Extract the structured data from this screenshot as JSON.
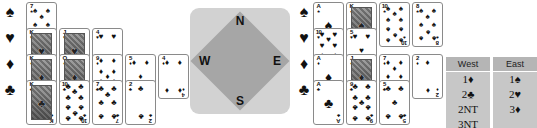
{
  "hands": {
    "west": {
      "label": "West hand",
      "suits": [
        {
          "suit": "spade",
          "symbol": "♠",
          "cards": [
            "7"
          ]
        },
        {
          "suit": "heart",
          "symbol": "♥",
          "cards": [
            "K",
            "J",
            "4"
          ]
        },
        {
          "suit": "diamond",
          "symbol": "♦",
          "cards": [
            "K",
            "Q",
            "9",
            "5",
            "4"
          ]
        },
        {
          "suit": "club",
          "symbol": "♣",
          "cards": [
            "K",
            "10",
            "7",
            "2"
          ]
        }
      ]
    },
    "east": {
      "label": "East hand",
      "suits": [
        {
          "suit": "spade",
          "symbol": "♠",
          "cards": [
            "A",
            "K",
            "10",
            "8"
          ]
        },
        {
          "suit": "heart",
          "symbol": "♥",
          "cards": [
            "10",
            "5"
          ]
        },
        {
          "suit": "diamond",
          "symbol": "♦",
          "cards": [
            "A",
            "J",
            "7",
            "2"
          ]
        },
        {
          "suit": "club",
          "symbol": "♣",
          "cards": [
            "A",
            "9",
            "5"
          ]
        }
      ]
    }
  },
  "compass": {
    "north": "N",
    "east": "E",
    "south": "S",
    "west": "W"
  },
  "auction": {
    "headers": [
      "West",
      "East"
    ],
    "rows": [
      [
        "1♦",
        "1♠"
      ],
      [
        "2♣",
        "2♥"
      ],
      [
        "2NT",
        "3♦"
      ],
      [
        "3NT",
        ""
      ]
    ]
  },
  "colors": {
    "ink": "#111111",
    "card_border": "#8a8a8a",
    "compass_outer": "#d2d2d2",
    "compass_inner": "#a6a6a6",
    "table_header_bg": "#b5b5b5",
    "table_cell_bg": "#c7c7c7"
  }
}
